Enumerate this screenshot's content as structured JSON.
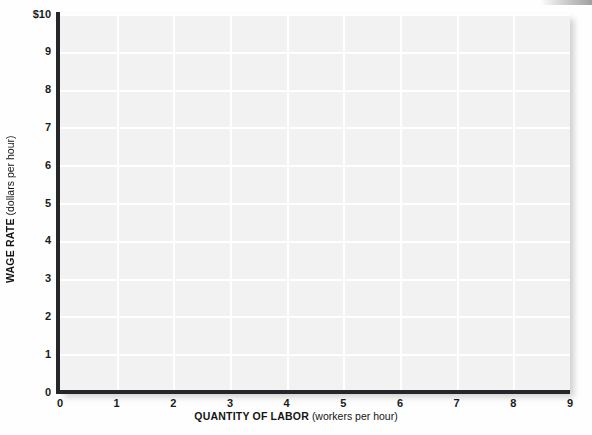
{
  "chart_data": {
    "type": "line",
    "title": "",
    "subtitle": "",
    "xlabel_bold": "QUANTITY OF LABOR",
    "xlabel_unit": "(workers per hour)",
    "ylabel_bold": "WAGE RATE",
    "ylabel_unit": "(dollars per hour)",
    "xlim": [
      0,
      9
    ],
    "ylim": [
      0,
      10
    ],
    "x_ticks": [
      "0",
      "1",
      "2",
      "3",
      "4",
      "5",
      "6",
      "7",
      "8",
      "9"
    ],
    "x_tick_values": [
      0,
      1,
      2,
      3,
      4,
      5,
      6,
      7,
      8,
      9
    ],
    "y_ticks": [
      "0",
      "1",
      "2",
      "3",
      "4",
      "5",
      "6",
      "7",
      "8",
      "9",
      "$10"
    ],
    "y_tick_values": [
      0,
      1,
      2,
      3,
      4,
      5,
      6,
      7,
      8,
      9,
      10
    ],
    "grid": true,
    "grid_color": "#ffffff",
    "plot_background": "#f2f2f2",
    "axis_color": "#26262a",
    "legend": [],
    "series": [],
    "annotations": [],
    "note": "Blank grid — no data series plotted"
  },
  "figure": {
    "page_background": "#fefefe",
    "x_axis_label_bold": "QUANTITY OF LABOR",
    "x_axis_label_unit": "(workers per hour)",
    "y_axis_label_bold": "WAGE RATE",
    "y_axis_label_unit": "(dollars per hour)"
  }
}
